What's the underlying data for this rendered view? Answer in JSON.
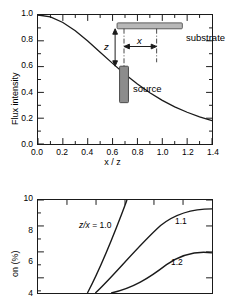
{
  "figure": {
    "background": "#ffffff",
    "line_color": "#1a1a1a",
    "substrate_fill": "#b8b8b8",
    "substrate_stroke": "#5a5a5a",
    "source_fill": "#8c8c8c",
    "source_stroke": "#4a4a4a"
  },
  "chart_data": [
    {
      "type": "line",
      "panel": "top",
      "title": "",
      "xlabel": "x / z",
      "ylabel": "Flux intensity",
      "xlim": [
        0.0,
        1.4
      ],
      "ylim": [
        0.0,
        1.0
      ],
      "xticks": [
        "0.0",
        "0.2",
        "0.4",
        "0.6",
        "0.8",
        "1.0",
        "1.2",
        "1.4"
      ],
      "xtick_values": [
        0.0,
        0.2,
        0.4,
        0.6,
        0.8,
        1.0,
        1.2,
        1.4
      ],
      "yticks": [
        "0.0",
        "0.2",
        "0.4",
        "0.6",
        "0.8",
        "1.0"
      ],
      "ytick_values": [
        0.0,
        0.2,
        0.4,
        0.6,
        0.8,
        1.0
      ],
      "grid": false,
      "legend": "none",
      "series": [
        {
          "name": "flux",
          "x": [
            0.0,
            0.1,
            0.2,
            0.3,
            0.4,
            0.5,
            0.6,
            0.7,
            0.8,
            0.9,
            1.0,
            1.1,
            1.2,
            1.3,
            1.4
          ],
          "values": [
            1.0,
            0.985,
            0.942,
            0.878,
            0.798,
            0.712,
            0.625,
            0.541,
            0.465,
            0.397,
            0.338,
            0.288,
            0.246,
            0.211,
            0.182
          ]
        }
      ],
      "inset": {
        "substrate_label": "substrate",
        "source_label": "source",
        "dimension_z": "z",
        "dimension_x": "x"
      }
    },
    {
      "type": "line",
      "panel": "bottom",
      "title": "",
      "xlabel": "",
      "ylabel": "on (%)",
      "ylim": [
        4,
        10
      ],
      "yticks": [
        "10",
        "8",
        "6",
        "4"
      ],
      "ytick_values": [
        10,
        8,
        6,
        4
      ],
      "grid": false,
      "legend": "inline-labels",
      "annotations": [
        {
          "text_prefix": "z/x",
          "text_suffix": " = 1.0",
          "value": 1.0
        },
        {
          "text_prefix": "",
          "text_suffix": "1.1",
          "value": 1.1
        },
        {
          "text_prefix": "",
          "text_suffix": "1.2",
          "value": 1.2
        }
      ],
      "series": [
        {
          "name": "z/x = 1.0",
          "values": []
        },
        {
          "name": "z/x = 1.1",
          "values": []
        },
        {
          "name": "z/x = 1.2",
          "values": []
        }
      ],
      "note": "panel cropped at image bottom edge"
    }
  ]
}
